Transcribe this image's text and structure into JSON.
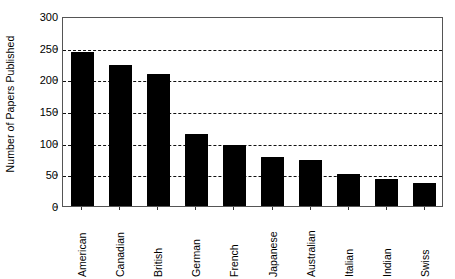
{
  "chart_data": {
    "type": "bar",
    "title": "",
    "subtitle": "",
    "xlabel": "",
    "ylabel": "Number of Papers Published",
    "categories": [
      "American",
      "Canadian",
      "British",
      "German",
      "French",
      "Japanese",
      "Australian",
      "Italian",
      "Indian",
      "Swiss"
    ],
    "values": [
      243,
      222,
      209,
      113,
      97,
      77,
      73,
      51,
      43,
      37
    ],
    "ylim": [
      0,
      300
    ],
    "ytick_values": [
      0,
      50,
      100,
      150,
      200,
      250,
      300
    ],
    "ytick_labels": [
      "0",
      "50",
      "100",
      "150",
      "200",
      "250",
      "300"
    ],
    "gridline_values": [
      50,
      100,
      150,
      200,
      250
    ],
    "grid": "horizontal-dashed",
    "legend": "none",
    "bar_color": "#000000",
    "orientation": "vertical",
    "xtick_label_rotation": 90,
    "annotations": []
  }
}
